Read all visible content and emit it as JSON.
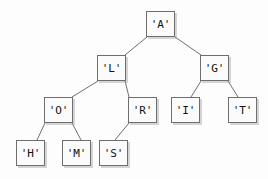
{
  "diagram": {
    "type": "binary-tree",
    "canvas": {
      "width": 268,
      "height": 179,
      "background": "#fdfdfd"
    },
    "style": {
      "node_fill": "#fbfbfb",
      "node_border": "#6e6e6e",
      "edge_color": "#6e6e6e",
      "text_color": "#111111"
    },
    "nodes": [
      {
        "id": "A",
        "label": "'A'",
        "x": 146,
        "y": 11,
        "w": 29,
        "h": 26,
        "level": 0
      },
      {
        "id": "L",
        "label": "'L'",
        "x": 97,
        "y": 55,
        "w": 29,
        "h": 26,
        "level": 1
      },
      {
        "id": "G",
        "label": "'G'",
        "x": 200,
        "y": 55,
        "w": 29,
        "h": 26,
        "level": 1
      },
      {
        "id": "O",
        "label": "'O'",
        "x": 44,
        "y": 97,
        "w": 29,
        "h": 26,
        "level": 2
      },
      {
        "id": "R",
        "label": "'R'",
        "x": 128,
        "y": 97,
        "w": 29,
        "h": 26,
        "level": 2
      },
      {
        "id": "I",
        "label": "'I'",
        "x": 171,
        "y": 97,
        "w": 29,
        "h": 26,
        "level": 2
      },
      {
        "id": "T",
        "label": "'T'",
        "x": 228,
        "y": 97,
        "w": 29,
        "h": 26,
        "level": 2
      },
      {
        "id": "H",
        "label": "'H'",
        "x": 16,
        "y": 140,
        "w": 29,
        "h": 26,
        "level": 3
      },
      {
        "id": "M",
        "label": "'M'",
        "x": 62,
        "y": 140,
        "w": 29,
        "h": 26,
        "level": 3
      },
      {
        "id": "S",
        "label": "'S'",
        "x": 99,
        "y": 140,
        "w": 29,
        "h": 26,
        "level": 3
      }
    ],
    "edges": [
      {
        "from": "A",
        "to": "L",
        "x1": 147,
        "y1": 37,
        "x2": 125,
        "y2": 55
      },
      {
        "from": "A",
        "to": "G",
        "x1": 175,
        "y1": 37,
        "x2": 201,
        "y2": 55
      },
      {
        "from": "L",
        "to": "O",
        "x1": 98,
        "y1": 81,
        "x2": 72,
        "y2": 97
      },
      {
        "from": "L",
        "to": "R",
        "x1": 125,
        "y1": 81,
        "x2": 129,
        "y2": 97
      },
      {
        "from": "G",
        "to": "I",
        "x1": 201,
        "y1": 81,
        "x2": 191,
        "y2": 97
      },
      {
        "from": "G",
        "to": "T",
        "x1": 228,
        "y1": 81,
        "x2": 238,
        "y2": 97
      },
      {
        "from": "O",
        "to": "H",
        "x1": 45,
        "y1": 123,
        "x2": 37,
        "y2": 140
      },
      {
        "from": "O",
        "to": "M",
        "x1": 72,
        "y1": 123,
        "x2": 81,
        "y2": 140
      },
      {
        "from": "R",
        "to": "S",
        "x1": 129,
        "y1": 123,
        "x2": 115,
        "y2": 140
      }
    ]
  }
}
